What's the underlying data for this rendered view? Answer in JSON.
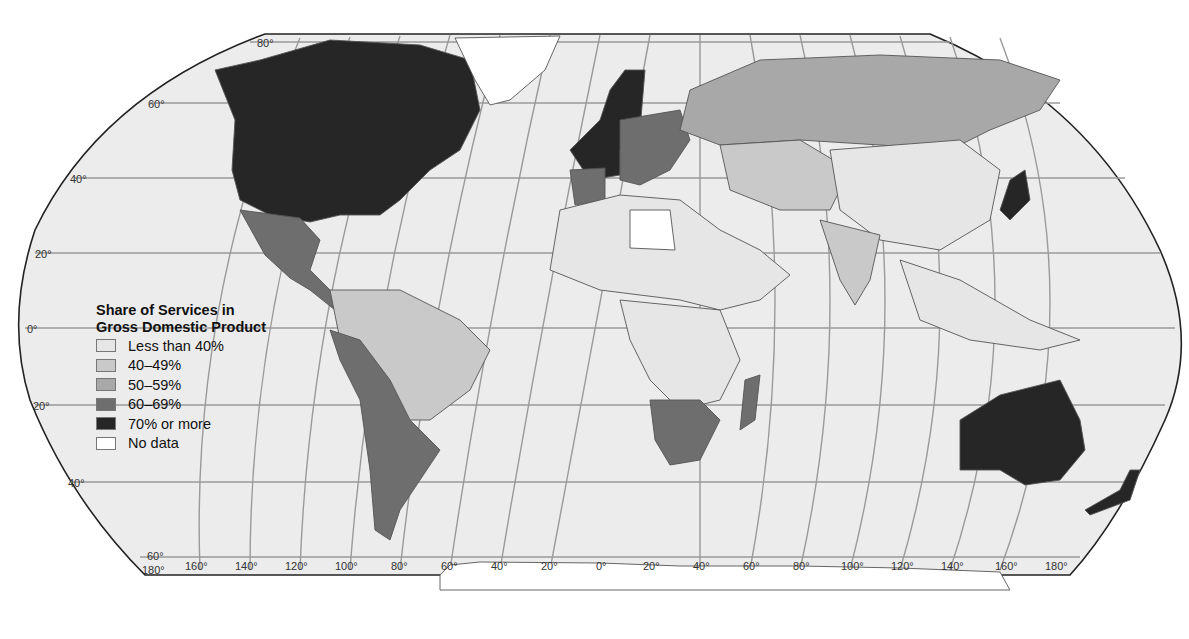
{
  "map": {
    "projection": "Robinson",
    "legend": {
      "title_line1": "Share of Services in",
      "title_line2": "Gross Domestic Product",
      "items": [
        {
          "label": "Less than 40%",
          "color": "#e6e6e6"
        },
        {
          "label": "40–49%",
          "color": "#c9c9c9"
        },
        {
          "label": "50–59%",
          "color": "#a8a8a8"
        },
        {
          "label": "60–69%",
          "color": "#6e6e6e"
        },
        {
          "label": "70% or more",
          "color": "#262626"
        },
        {
          "label": "No data",
          "color": "#ffffff"
        }
      ]
    },
    "latitude_labels": [
      "80°",
      "60°",
      "40°",
      "20°",
      "0°",
      "20°",
      "40°",
      "60°"
    ],
    "longitude_labels": [
      "180°",
      "160°",
      "140°",
      "120°",
      "100°",
      "80°",
      "60°",
      "40°",
      "20°",
      "0°",
      "20°",
      "40°",
      "60°",
      "80°",
      "100°",
      "120°",
      "140°",
      "160°",
      "180°"
    ],
    "colors": {
      "ocean": "#ececec",
      "graticule": "#9a9a9a",
      "border": "#555555"
    }
  }
}
